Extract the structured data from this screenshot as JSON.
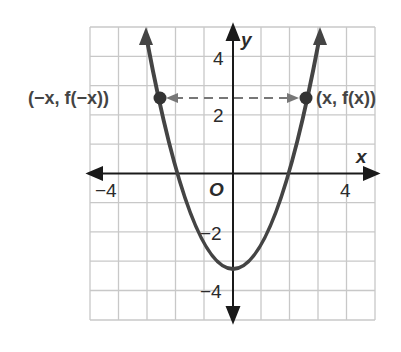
{
  "figure": {
    "function": "f(x) = x^2 - 4",
    "x_axis_label": "x",
    "y_axis_label": "y",
    "origin_label": "O",
    "x_tick_labels": [
      {
        "value": -4,
        "label": "−4"
      },
      {
        "value": 4,
        "label": "4"
      }
    ],
    "y_tick_labels": [
      {
        "value": 4,
        "label": "4"
      },
      {
        "value": 2,
        "label": "2"
      },
      {
        "value": -2,
        "label": "−2"
      },
      {
        "value": -4,
        "label": "−4"
      }
    ],
    "grid": {
      "x_min": -5,
      "x_max": 5,
      "y_min": -5,
      "y_max": 5,
      "step": 1
    },
    "points": [
      {
        "label": "(−x, f(−x))",
        "x": -2.55,
        "y": 2.5
      },
      {
        "label": "(x, f(x))",
        "x": 2.55,
        "y": 2.5
      }
    ],
    "colors": {
      "curve": "#444444",
      "grid": "#c8c8c8",
      "axis": "#1a1a1a",
      "dash": "#777777"
    }
  }
}
